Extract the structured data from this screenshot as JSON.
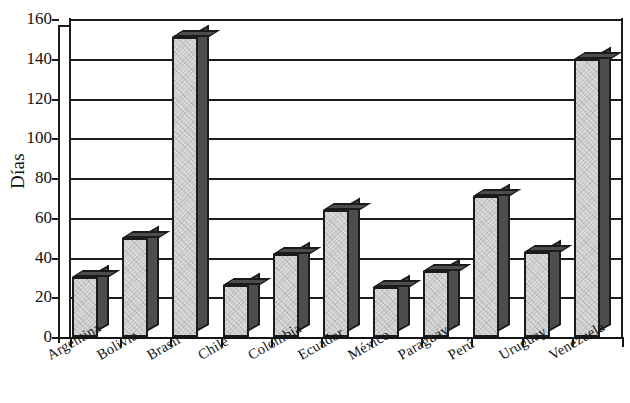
{
  "chart_data": {
    "type": "bar",
    "title": "",
    "xlabel": "",
    "ylabel": "Días",
    "ylim": [
      0,
      160
    ],
    "ytick_step": 20,
    "yticks": [
      "160",
      "140",
      "120",
      "100",
      "80",
      "60",
      "40",
      "20",
      "0"
    ],
    "grid": true,
    "legend": false,
    "categories": [
      "Argentina",
      "Bolivia",
      "Brasil",
      "Chile",
      "Colombia",
      "Ecuador",
      "México",
      "Paraguay",
      "Perú",
      "Uruguay",
      "Venezuela"
    ],
    "values": [
      30,
      50,
      151,
      26,
      42,
      64,
      25,
      33,
      71,
      43,
      140
    ],
    "bar_style": "3d-block",
    "colors": {
      "bar_front": "#d9d9d9",
      "bar_side": "#4d4d4d",
      "outline": "#1b1b1b",
      "gridline": "#1b1b1b",
      "background": "#ffffff",
      "text": "#141414"
    }
  }
}
